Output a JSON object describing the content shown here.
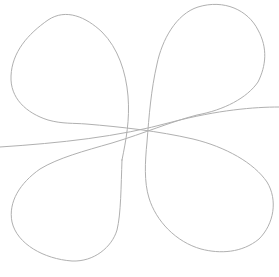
{
  "canvas": {
    "width": 279,
    "height": 277,
    "background_color": "#ffffff"
  },
  "figure": {
    "kind": "four-petal clover curve with secant line",
    "stroke_color": "#b0b0b0",
    "stroke_width": 1,
    "viewbox": "0 0 279 277",
    "paths": {
      "clover": "M 122,160 C 126,140 130,120 128,96 C 126,72 118,48 102,32 C 86,17 66,8 48,20 C 28,34 12,52 11,76 C 10,98 26,113 48,120 C 62,124 74,123 86,124 C 122,127 158,131 193,139 C 226,147 254,163 267,182 C 278,200 274,224 259,239 C 242,253 220,254 201,249 C 176,242 156,221 149,198 C 144,182 145,162 147,142 C 149,116 151,90 157,64 C 162,40 176,14 198,7 C 224,-1 248,10 258,30 C 268,48 266,66 258,82 C 247,98 224,110 197,115 C 170,122 145,133 112,143 C 84,151 58,158 40,169 C 20,183 8,202 12,222 C 17,244 44,259 72,261 C 94,262 112,247 117,230 C 121,214 121,186 122,160 Z",
      "secant_line": "M 0,147 C 60,143 118,137 172,122 C 218,110 254,107 279,107"
    }
  }
}
